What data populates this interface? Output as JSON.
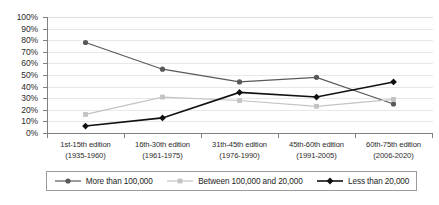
{
  "chart_data": {
    "type": "line",
    "title": "",
    "xlabel": "",
    "ylabel": "",
    "ylim": [
      0,
      100
    ],
    "grid": true,
    "legend_position": "bottom",
    "categories": [
      "1st-15th edition (1935-1960)",
      "16th-30th edition (1961-1975)",
      "31th-45th edition (1976-1990)",
      "45th-60th edition (1991-2005)",
      "60th-75th edition (2006-2020)"
    ],
    "category_lines": [
      [
        "1st-15th edition",
        "(1935-1960)"
      ],
      [
        "16th-30th edition",
        "(1961-1975)"
      ],
      [
        "31th-45th edition",
        "(1976-1990)"
      ],
      [
        "45th-60th edition",
        "(1991-2005)"
      ],
      [
        "60th-75th edition",
        "(2006-2020)"
      ]
    ],
    "ytick_labels": [
      "0%",
      "10%",
      "20%",
      "30%",
      "40%",
      "50%",
      "60%",
      "70%",
      "80%",
      "90%",
      "100%"
    ],
    "ytick_values": [
      0,
      10,
      20,
      30,
      40,
      50,
      60,
      70,
      80,
      90,
      100
    ],
    "series": [
      {
        "name": "More than 100,000",
        "values": [
          78,
          55,
          44,
          48,
          25
        ],
        "color": "#595959",
        "marker": "circle"
      },
      {
        "name": "Between 100,000 and 20,000",
        "values": [
          16,
          31,
          28,
          23,
          29
        ],
        "color": "#c3c3c3",
        "marker": "square"
      },
      {
        "name": "Less than 20,000",
        "values": [
          6,
          13,
          35,
          31,
          44
        ],
        "color": "#111111",
        "marker": "diamond"
      }
    ]
  },
  "legend": {
    "items": [
      {
        "label": "More than 100,000"
      },
      {
        "label": "Between 100,000 and 20,000"
      },
      {
        "label": "Less than 20,000"
      }
    ]
  },
  "colors": {
    "axis": "#808080",
    "grid": "#e8e8e8",
    "text": "#2b2b2b",
    "background": "#ffffff"
  }
}
